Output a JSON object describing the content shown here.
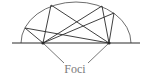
{
  "diagram": {
    "label": "Foci",
    "colors": {
      "ellipse": "#6e6e6e",
      "lines": "#2a2a2a",
      "label": "#7a7a7a",
      "background": "#ffffff"
    },
    "ellipse": {
      "cx": 76,
      "cy": 43,
      "rx": 55,
      "ry": 41
    },
    "baseline": {
      "x1": 12,
      "y1": 43,
      "x2": 140,
      "y2": 43
    },
    "foci": [
      {
        "name": "left-focus",
        "x": 43,
        "y": 43
      },
      {
        "name": "right-focus",
        "x": 109,
        "y": 43
      }
    ],
    "reflection_points": [
      {
        "x": 51,
        "y": 5
      },
      {
        "x": 102,
        "y": 6
      },
      {
        "x": 114,
        "y": 13
      },
      {
        "x": 25,
        "y": 28
      }
    ],
    "label_position": {
      "x": 75,
      "y": 73
    },
    "pointer_lines": [
      {
        "x1": 43,
        "y1": 43,
        "x2": 64,
        "y2": 63
      },
      {
        "x1": 109,
        "y1": 43,
        "x2": 88,
        "y2": 63
      }
    ]
  }
}
